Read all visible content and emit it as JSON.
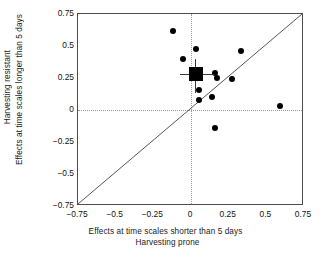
{
  "chart_data": {
    "type": "scatter",
    "title": "",
    "xlabel": "Effects at time scales shorter than 5 days",
    "xlabel_line2": "Harvesting prone",
    "ylabel": "Harvesting resistant",
    "ylabel_line2": "Effects at time scales longer than 5 days",
    "xlim": [
      -0.75,
      0.75
    ],
    "ylim": [
      -0.75,
      0.75
    ],
    "xticks": [
      "−0.75",
      "−0.5",
      "−0.25",
      "0",
      "0.25",
      "0.5",
      "0.75"
    ],
    "xtick_values": [
      -0.75,
      -0.5,
      -0.25,
      0,
      0.25,
      0.5,
      0.75
    ],
    "yticks": [
      "0.75",
      "0.5",
      "0.25",
      "0",
      "−0.25",
      "−0.5",
      "−0.75"
    ],
    "ytick_values": [
      0.75,
      0.5,
      0.25,
      0,
      -0.25,
      -0.5,
      -0.75
    ],
    "grid": false,
    "legend": "none",
    "reference_lines": [
      {
        "name": "zero-vertical",
        "x": 0,
        "style": "dotted"
      },
      {
        "name": "zero-horizontal",
        "y": 0,
        "style": "dotted"
      },
      {
        "name": "identity",
        "from": [
          -0.75,
          -0.75
        ],
        "to": [
          0.75,
          0.75
        ],
        "style": "solid"
      }
    ],
    "points": [
      {
        "x": -0.12,
        "y": 0.62
      },
      {
        "x": -0.05,
        "y": 0.4
      },
      {
        "x": 0.03,
        "y": 0.48
      },
      {
        "x": 0.33,
        "y": 0.46
      },
      {
        "x": 0.16,
        "y": 0.29
      },
      {
        "x": 0.17,
        "y": 0.25
      },
      {
        "x": 0.27,
        "y": 0.24
      },
      {
        "x": 0.05,
        "y": 0.16
      },
      {
        "x": 0.14,
        "y": 0.1
      },
      {
        "x": 0.05,
        "y": 0.08
      },
      {
        "x": 0.59,
        "y": 0.03
      },
      {
        "x": 0.16,
        "y": -0.14
      }
    ],
    "mean_marker": {
      "x": 0.03,
      "y": 0.28,
      "xerr_low": -0.07,
      "xerr_high": 0.15,
      "yerr_low": 0.13,
      "yerr_high": 0.4,
      "marker": "square"
    },
    "colors": {
      "point": "#000000",
      "mean": "#000000",
      "error_bar": "#3a3a3a",
      "reference": "#9a9a9a",
      "frame": "#4d4d4d",
      "text": "#111111"
    }
  }
}
